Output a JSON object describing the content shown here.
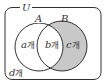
{
  "diagram": {
    "type": "venn",
    "universe_label": "U",
    "sets": [
      {
        "name": "A",
        "label": "A"
      },
      {
        "name": "B",
        "label": "B"
      }
    ],
    "regions": {
      "a_only": {
        "var": "a",
        "unit": "개"
      },
      "a_and_b": {
        "var": "b",
        "unit": "개"
      },
      "b_only": {
        "var": "c",
        "unit": "개",
        "shaded": true
      },
      "outside": {
        "var": "d",
        "unit": "개"
      }
    },
    "colors": {
      "stroke": "#333333",
      "shade": "#c8c8c8",
      "background": "#ffffff"
    }
  }
}
